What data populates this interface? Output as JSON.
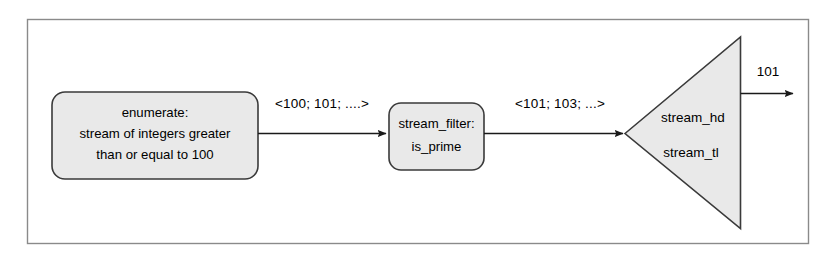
{
  "figure": {
    "frame": {
      "border_color": "#8a8a8a",
      "background": "#ffffff"
    },
    "node_fill": "#e9e9e9",
    "node_stroke": "#3a3a3a",
    "line_color": "#1a1a1a",
    "text_color": "#000000"
  },
  "nodes": {
    "enumerate": {
      "name": "enumerate-box",
      "lines": [
        "enumerate:",
        "stream of integers greater",
        "than or equal to 100"
      ]
    },
    "filter": {
      "name": "stream-filter-box",
      "lines": [
        "stream_filter:",
        "is_prime"
      ]
    },
    "triangle": {
      "name": "stream-cons-triangle",
      "head_label": "stream_hd",
      "tail_label": "stream_tl"
    }
  },
  "edges": {
    "enumerate_to_filter": {
      "label": "<100; 101; ....>"
    },
    "filter_to_triangle": {
      "label": "<101; 103; ...>"
    },
    "triangle_output": {
      "label": "101"
    }
  }
}
